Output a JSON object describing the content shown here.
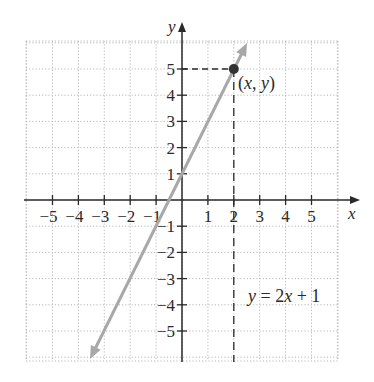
{
  "chart_data": {
    "type": "line",
    "title": "",
    "equation_label": "y = 2x + 1",
    "xlabel": "x",
    "ylabel": "y",
    "xlim": [
      -6,
      6
    ],
    "ylim": [
      -6,
      6
    ],
    "grid": true,
    "grid_style": "dotted",
    "x_ticks": [
      -5,
      -4,
      -3,
      -2,
      -1,
      1,
      2,
      3,
      4,
      5
    ],
    "x_tick_labels": [
      "−5",
      "−4",
      "−3",
      "−2",
      "−1",
      "1",
      "2",
      "3",
      "4",
      "5"
    ],
    "y_ticks": [
      5,
      4,
      3,
      2,
      1,
      -1,
      -2,
      -3,
      -4,
      -5
    ],
    "y_tick_labels": [
      "5",
      "4",
      "3",
      "2",
      "1",
      "−1",
      "−2",
      "−3",
      "−4",
      "−5"
    ],
    "series": [
      {
        "name": "y = 2x + 1",
        "slope": 2,
        "intercept": 1,
        "x": [
          -3.5,
          2.6
        ],
        "y": [
          -6,
          6.2
        ],
        "color": "#a8a8a8",
        "arrows": "both"
      }
    ],
    "highlighted_point": {
      "label": "(x, y)",
      "x": 2,
      "y": 5,
      "color": "#333333",
      "dashed_guides": true
    }
  },
  "labels": {
    "point": "(x, y)",
    "equation": "y = 2x + 1",
    "x_axis": "x",
    "y_axis": "y"
  },
  "colors": {
    "axis": "#2a2a2a",
    "grid": "#b8b8b8",
    "line": "#a8a8a8",
    "point": "#333333"
  }
}
